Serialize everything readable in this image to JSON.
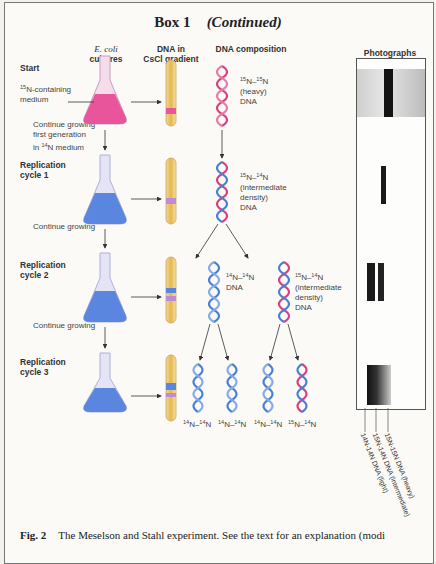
{
  "title": {
    "main": "Box 1",
    "sub": "(Continued)"
  },
  "columns": {
    "cultures": {
      "line1": "E. coli",
      "line2": "cultures"
    },
    "gradient": {
      "line1": "DNA in",
      "line2": "CsCl gradient"
    },
    "composition": "DNA composition",
    "photos": {
      "line1": "Photographs",
      "line2": "of DNA bands"
    }
  },
  "rows": [
    {
      "label1": "Start",
      "label2": ""
    },
    {
      "label1": "Replication",
      "label2": "cycle 1"
    },
    {
      "label1": "Replication",
      "label2": "cycle 2"
    },
    {
      "label1": "Replication",
      "label2": "cycle 3"
    }
  ],
  "notes": {
    "medium": {
      "sup": "15",
      "text": "N-containing",
      "line2": "medium"
    },
    "step1": {
      "line1": "Continue growing",
      "line2": "first generation",
      "line3_pre": "in ",
      "line3_sup": "14",
      "line3_post": "N medium"
    },
    "step2": "Continue growing",
    "step3": "Continue growing"
  },
  "dna_labels": {
    "start": {
      "a": "15",
      "b": "15",
      "line2": "(heavy)",
      "line3": "DNA"
    },
    "cycle1": {
      "a": "15",
      "b": "14",
      "line2": "(intermediate",
      "line3": "density)",
      "line4": "DNA"
    },
    "cycle2_left": {
      "a": "14",
      "b": "14",
      "line2": "DNA"
    },
    "cycle2_right": {
      "a": "15",
      "b": "14",
      "line2": "(intermediate",
      "line3": "density)",
      "line4": "DNA"
    },
    "cycle3": [
      {
        "a": "14",
        "b": "14"
      },
      {
        "a": "14",
        "b": "14"
      },
      {
        "a": "14",
        "b": "14"
      },
      {
        "a": "15",
        "b": "14"
      }
    ]
  },
  "band_labels": [
    "14N-14N DNA (light)",
    "15N-14N DNA (intermediate)",
    "15N-15N DNA (heavy)"
  ],
  "caption": {
    "fig": "Fig. 2",
    "text": "The Meselson and Stahl experiment. See the text for an explanation (modi"
  },
  "colors": {
    "heavy_medium": "#e8559a",
    "light_medium": "#5b86e0",
    "heavy_strand": "#d8407f",
    "light_strand": "#4a7fd6",
    "tube": "#e9c265",
    "band": "#1a1a1a"
  }
}
